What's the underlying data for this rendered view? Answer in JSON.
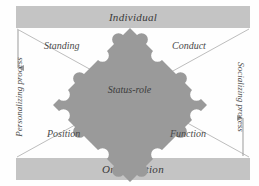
{
  "diagram": {
    "title_top": "Individual",
    "title_bottom": "Organization",
    "center": "Status-role",
    "quadrants": {
      "top_left": "Standing",
      "top_right": "Conduct",
      "bottom_left": "Position",
      "bottom_right": "Function"
    },
    "sides": {
      "left": "Personalizing process",
      "right": "Socializing process"
    },
    "colors": {
      "band": "#c4c4c4",
      "puzzle": "#9a9a9a",
      "line": "#b8b8b8",
      "text": "#3a3a3a"
    }
  }
}
